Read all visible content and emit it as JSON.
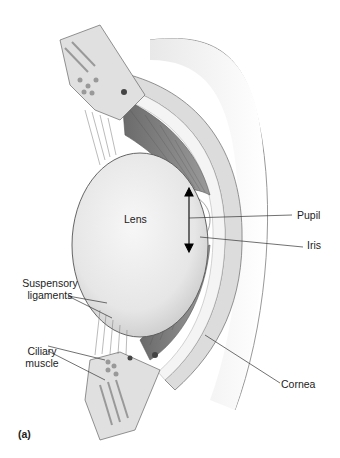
{
  "figure": {
    "panel_label": "(a)",
    "labels": {
      "lens": "Lens",
      "pupil": "Pupil",
      "iris": "Iris",
      "suspensory_line1": "Suspensory",
      "suspensory_line2": "ligaments",
      "ciliary_line1": "Ciliary",
      "ciliary_line2": "muscle",
      "cornea": "Cornea"
    }
  }
}
